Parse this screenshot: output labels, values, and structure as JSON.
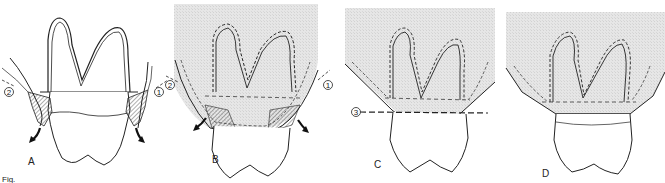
{
  "figure": {
    "caption_fragment": "Fig.",
    "panels": [
      {
        "id": "A",
        "label": "A",
        "markers": [
          "2",
          "1"
        ]
      },
      {
        "id": "B",
        "label": "B",
        "markers": [
          "2",
          "1"
        ]
      },
      {
        "id": "C",
        "label": "C",
        "markers": [
          "3"
        ]
      },
      {
        "id": "D",
        "label": "D",
        "markers": []
      }
    ]
  },
  "colors": {
    "bone_shading": "#e4e4e4",
    "line": "#222222",
    "background": "#ffffff"
  }
}
